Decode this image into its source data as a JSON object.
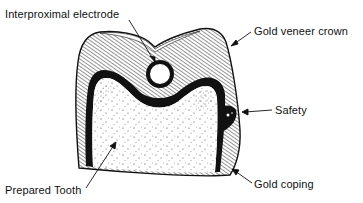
{
  "labels": {
    "electrode": "Interproximal electrode",
    "crown": "Gold veneer crown",
    "safety": "Safety",
    "tooth": "Prepared Tooth",
    "coping": "Gold coping"
  },
  "colors": {
    "ink": "#111111",
    "background": "#ffffff"
  }
}
